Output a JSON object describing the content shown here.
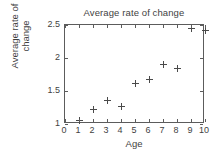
{
  "chart_data": {
    "type": "scatter",
    "title": "Average rate of change",
    "xlabel": "Age",
    "ylabel_lines": [
      "Average rate of",
      "change"
    ],
    "ylabel": "Average rate of change",
    "x": [
      1,
      2,
      3,
      4,
      5,
      6,
      7,
      8,
      9,
      10
    ],
    "values": [
      1.05,
      1.22,
      1.35,
      1.27,
      1.61,
      1.67,
      1.9,
      1.84,
      2.45,
      2.42
    ],
    "series": [
      {
        "name": "Average rate of change",
        "points": [
          {
            "x": 1,
            "y": 1.05
          },
          {
            "x": 2,
            "y": 1.22
          },
          {
            "x": 3,
            "y": 1.35
          },
          {
            "x": 4,
            "y": 1.27
          },
          {
            "x": 5,
            "y": 1.61
          },
          {
            "x": 6,
            "y": 1.67
          },
          {
            "x": 7,
            "y": 1.9
          },
          {
            "x": 8,
            "y": 1.84
          },
          {
            "x": 9,
            "y": 2.45
          },
          {
            "x": 10,
            "y": 2.42
          }
        ]
      }
    ],
    "xlim": [
      0,
      10
    ],
    "ylim": [
      1,
      2.5
    ],
    "xticks": [
      0,
      1,
      2,
      3,
      4,
      5,
      6,
      7,
      8,
      9,
      10
    ],
    "xtick_labels": [
      "0",
      "1",
      "2",
      "3",
      "4",
      "5",
      "6",
      "7",
      "8",
      "9",
      "10"
    ],
    "yticks": [
      1,
      1.5,
      2,
      2.5
    ],
    "ytick_labels": [
      "1",
      "1.5",
      "2",
      "2.5"
    ],
    "grid": false,
    "legend": null,
    "marker": "plus",
    "marker_color": "#4a4a4a",
    "axis_color": "#5c5c5c",
    "background": "#ffffff"
  }
}
